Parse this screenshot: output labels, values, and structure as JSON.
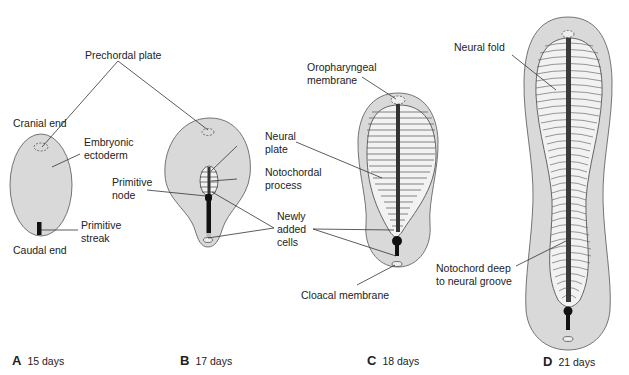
{
  "figure": {
    "colors": {
      "disc_fill": "#d9d9d9",
      "disc_stroke": "#555555",
      "plate_fill": "#f2f2f2",
      "notochord": "#3a3a3a",
      "streak": "#111111",
      "leader": "#333333"
    },
    "labels": {
      "prechordal_plate": "Prechordal plate",
      "cranial_end": "Cranial end",
      "embryonic_ectoderm": "Embryonic\nectoderm",
      "primitive_node": "Primitive\nnode",
      "primitive_streak": "Primitive\nstreak",
      "caudal_end": "Caudal end",
      "neural_plate": "Neural\nplate",
      "notochordal_process": "Notochordal\nprocess",
      "newly_added_cells": "Newly\nadded\ncells",
      "oropharyngeal_membrane": "Oropharyngeal\nmembrane",
      "cloacal_membrane": "Cloacal membrane",
      "neural_fold": "Neural fold",
      "notochord_deep": "Notochord deep\nto neural groove"
    },
    "panels": [
      {
        "letter": "A",
        "age": "15 days"
      },
      {
        "letter": "B",
        "age": "17 days"
      },
      {
        "letter": "C",
        "age": "18 days"
      },
      {
        "letter": "D",
        "age": "21 days"
      }
    ]
  }
}
